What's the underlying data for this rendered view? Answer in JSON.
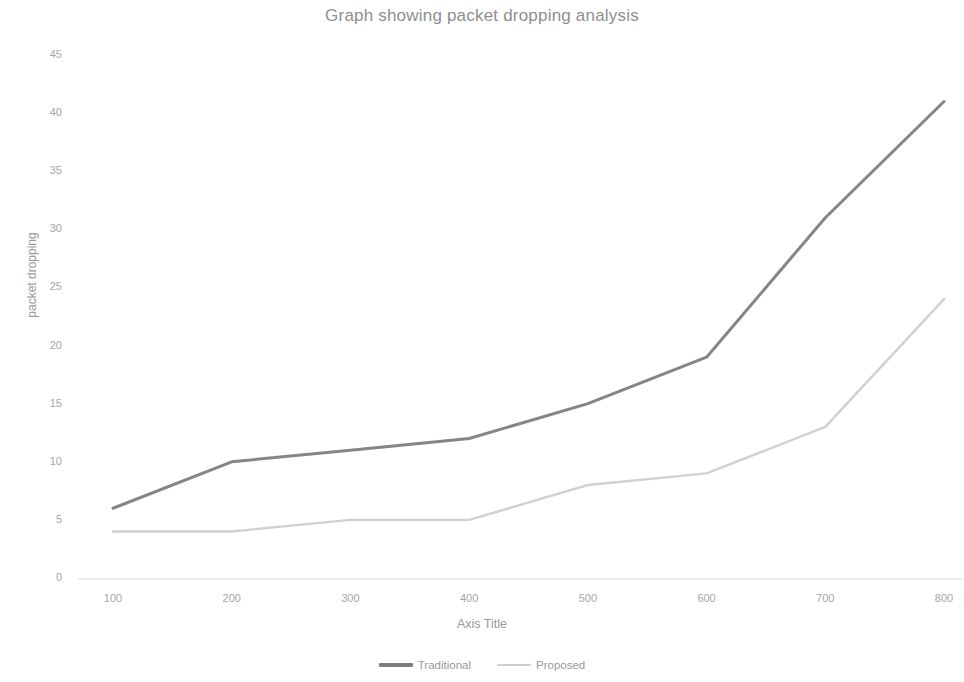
{
  "chart_data": {
    "type": "line",
    "title": "Graph showing packet dropping analysis",
    "xlabel": "Axis Title",
    "ylabel": "packet dropping",
    "x": [
      100,
      200,
      300,
      400,
      500,
      600,
      700,
      800
    ],
    "xticklabels": [
      "100",
      "200",
      "300",
      "400",
      "500",
      "600",
      "700",
      "800"
    ],
    "yticklabels": [
      "45",
      "40",
      "35",
      "30",
      "25",
      "20",
      "15",
      "10",
      "5",
      "0"
    ],
    "yticks": [
      45,
      40,
      35,
      30,
      25,
      20,
      15,
      10,
      5,
      0
    ],
    "xlim": [
      100,
      800
    ],
    "ylim": [
      0,
      45
    ],
    "grid": false,
    "legend_position": "bottom",
    "series": [
      {
        "name": "Traditional",
        "color": "#7e7e7e",
        "values": [
          6,
          10,
          11,
          12,
          15,
          19,
          31,
          41
        ]
      },
      {
        "name": "Proposed",
        "color": "#cfcfcf",
        "values": [
          4,
          4,
          5,
          5,
          8,
          9,
          13,
          24
        ]
      }
    ]
  },
  "legend": {
    "items": [
      {
        "label": "Traditional"
      },
      {
        "label": "Proposed"
      }
    ]
  },
  "colors": {
    "title": "#7f7f7f",
    "tick": "#969696",
    "axis": "#d9d9d9",
    "series_traditional": "#7e7e7e",
    "series_proposed": "#cfcfcf"
  }
}
